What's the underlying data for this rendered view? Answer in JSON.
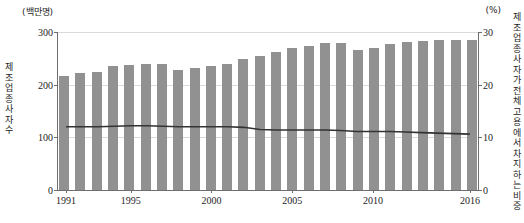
{
  "chart_data": {
    "type": "bar",
    "title": "",
    "xlabel": "",
    "ylabel": "제조업 종사자 수",
    "y2label": "제조업 종사자가 전체 고용에서 차지하는 비중",
    "unit_left": "(백만명)",
    "unit_right": "(%)",
    "grid": true,
    "legend": "none",
    "ylim": [
      0,
      300
    ],
    "y2lim": [
      0,
      30
    ],
    "yticks": [
      0,
      100,
      200,
      300
    ],
    "y2ticks": [
      0,
      10,
      20,
      30
    ],
    "xticks": [
      "1991",
      "1995",
      "2000",
      "2005",
      "2010",
      "2016"
    ],
    "categories": [
      "1991",
      "1992",
      "1993",
      "1994",
      "1995",
      "1996",
      "1997",
      "1998",
      "1999",
      "2000",
      "2001",
      "2002",
      "2003",
      "2004",
      "2005",
      "2006",
      "2007",
      "2008",
      "2009",
      "2010",
      "2011",
      "2012",
      "2013",
      "2014",
      "2015",
      "2016"
    ],
    "series": [
      {
        "name": "제조업 종사자 수",
        "type": "bar",
        "axis": "left",
        "unit": "백만명",
        "color": "#919191",
        "values": [
          217,
          222,
          224,
          235,
          238,
          240,
          240,
          228,
          232,
          236,
          240,
          248,
          255,
          262,
          270,
          274,
          279,
          280,
          265,
          270,
          278,
          281,
          282,
          284,
          284,
          285
        ]
      },
      {
        "name": "제조업 종사자가 전체 고용에서 차지하는 비중",
        "type": "line",
        "axis": "right",
        "unit": "%",
        "color": "#333333",
        "values": [
          12.0,
          12.0,
          12.0,
          12.1,
          12.2,
          12.2,
          12.1,
          12.0,
          12.0,
          12.0,
          12.0,
          11.9,
          11.5,
          11.4,
          11.4,
          11.4,
          11.4,
          11.3,
          11.1,
          11.1,
          11.1,
          11.0,
          10.9,
          10.8,
          10.7,
          10.6
        ]
      }
    ]
  }
}
